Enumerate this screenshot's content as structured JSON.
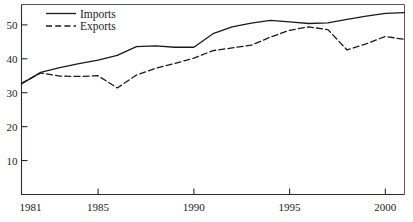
{
  "chart_data": {
    "type": "line",
    "title": "",
    "xlabel": "",
    "ylabel": "",
    "xlim": [
      1981,
      2001
    ],
    "ylim": [
      0,
      56
    ],
    "grid": false,
    "legend_position": "top-left",
    "xticks": [
      1981,
      1985,
      1990,
      1995,
      2000
    ],
    "xtick_labels": [
      "1981",
      "1985",
      "1990",
      "1995",
      "2000"
    ],
    "yticks": [
      10,
      20,
      30,
      40,
      50
    ],
    "ytick_labels": [
      "10",
      "20",
      "30",
      "40",
      "50"
    ],
    "x": [
      1981,
      1982,
      1983,
      1984,
      1985,
      1986,
      1987,
      1988,
      1989,
      1990,
      1991,
      1992,
      1993,
      1994,
      1995,
      1996,
      1997,
      1998,
      1999,
      2000,
      2001
    ],
    "series": [
      {
        "name": "Imports",
        "style": "solid",
        "color": "#1a1a1a",
        "values": [
          32.6,
          36.0,
          37.4,
          38.6,
          39.6,
          41.0,
          43.6,
          43.8,
          43.4,
          43.4,
          47.4,
          49.4,
          50.5,
          51.3,
          50.9,
          50.4,
          50.6,
          51.6,
          52.6,
          53.4,
          53.6
        ]
      },
      {
        "name": "Exports",
        "style": "dashed",
        "color": "#1a1a1a",
        "values": [
          32.8,
          35.8,
          34.9,
          34.8,
          35.0,
          31.4,
          35.2,
          37.2,
          38.6,
          40.2,
          42.4,
          43.2,
          44.0,
          46.4,
          48.4,
          49.4,
          48.6,
          42.6,
          44.4,
          46.6,
          45.7
        ]
      }
    ]
  },
  "legend": {
    "items": [
      {
        "label": "Imports",
        "style": "solid"
      },
      {
        "label": "Exports",
        "style": "dashed"
      }
    ]
  }
}
